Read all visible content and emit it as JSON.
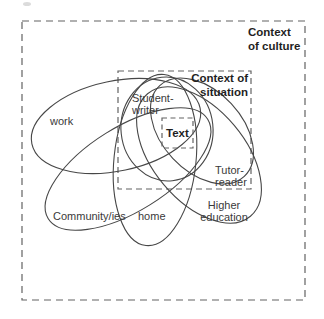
{
  "diagram": {
    "culture_box": {
      "label_line1": "Context",
      "label_line2": "of culture"
    },
    "situation_box": {
      "label_line1": "Context of",
      "label_line2": "situation"
    },
    "text_box": {
      "label": "Text"
    },
    "ellipses": {
      "work": {
        "label": "work"
      },
      "student_writer": {
        "label_line1": "Student-",
        "label_line2": "writer"
      },
      "tutor_reader": {
        "label_line1": "Tutor-",
        "label_line2": "reader"
      },
      "community": {
        "label": "Community/ies"
      },
      "home": {
        "label": "home"
      },
      "higher_education": {
        "label_line1": "Higher",
        "label_line2": "education"
      }
    },
    "colors": {
      "line": "#474747",
      "dash": "#636363",
      "text": "#3a3a3a",
      "text-bold": "#1f1f1f",
      "background": "#ffffff"
    }
  }
}
